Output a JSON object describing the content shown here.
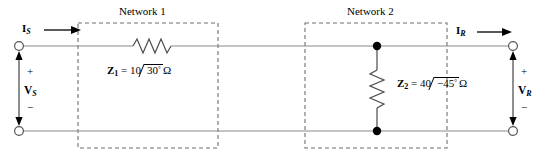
{
  "figure": {
    "name": "two-port-cascade-circuit",
    "line_color": "#8a8a8a",
    "dash_color": "#6e6e6e",
    "ink_color": "#000000"
  },
  "networks": [
    {
      "id": "network-1",
      "title": "Network 1"
    },
    {
      "id": "network-2",
      "title": "Network 2"
    }
  ],
  "currents": [
    {
      "id": "source-current",
      "symbol": "I",
      "subscript": "S"
    },
    {
      "id": "receiving-current",
      "symbol": "I",
      "subscript": "R"
    }
  ],
  "voltages": [
    {
      "id": "source-voltage",
      "symbol": "V",
      "subscript": "S",
      "plus": "+",
      "minus": "−"
    },
    {
      "id": "receiving-voltage",
      "symbol": "V",
      "subscript": "R",
      "plus": "+",
      "minus": "−"
    }
  ],
  "impedances": [
    {
      "id": "z1",
      "symbol": "Z",
      "subscript": "1",
      "equals": "=",
      "magnitude": "10",
      "angle": "30",
      "degree": "°",
      "unit": "Ω",
      "full_text": "Z1 = 10 ∠ 30° Ω",
      "orientation": "series-horizontal"
    },
    {
      "id": "z2",
      "symbol": "Z",
      "subscript": "2",
      "equals": "=",
      "magnitude": "40",
      "angle": "−45",
      "degree": "°",
      "unit": "Ω",
      "full_text": "Z2 = 40 ∠ −45° Ω",
      "orientation": "shunt-vertical"
    }
  ],
  "terminals": [
    {
      "id": "terminal-source-top",
      "style": "open-circle"
    },
    {
      "id": "terminal-source-bottom",
      "style": "open-circle"
    },
    {
      "id": "terminal-receiving-top",
      "style": "open-circle"
    },
    {
      "id": "terminal-receiving-bottom",
      "style": "open-circle"
    }
  ],
  "junctions": [
    {
      "id": "junction-top",
      "style": "filled-dot"
    },
    {
      "id": "junction-bottom",
      "style": "filled-dot"
    }
  ]
}
